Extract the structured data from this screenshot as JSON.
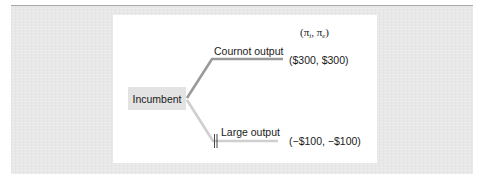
{
  "diagram": {
    "type": "game-tree",
    "payoff_header": {
      "open": "(",
      "symbol1": "π",
      "sub1": "i",
      "sep": ", ",
      "symbol2": "π",
      "sub2": "e",
      "close": ")"
    },
    "root": {
      "label": "Incumbent"
    },
    "branches": [
      {
        "label": "Cournot output",
        "payoff": "($300, $300)",
        "pruned": false
      },
      {
        "label": "Large output",
        "payoff": "(−$100, −$100)",
        "pruned": true
      }
    ],
    "colors": {
      "background": "#e8e8e8",
      "card": "#ffffff",
      "node_fill": "#e3e3e3",
      "chosen_branch": "#9a9a9a",
      "pruned_branch": "#cfcfcf",
      "text": "#1a1a1a"
    }
  }
}
